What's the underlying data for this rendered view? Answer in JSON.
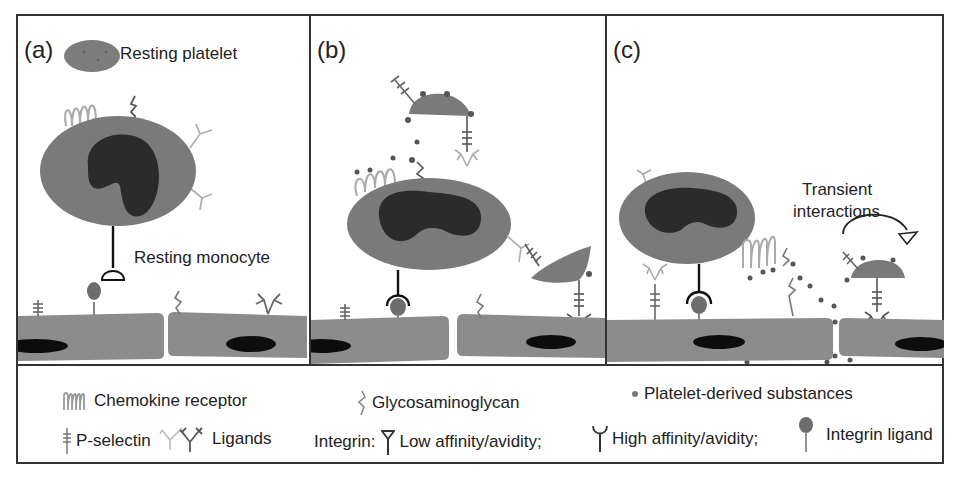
{
  "figure": {
    "panels": [
      {
        "id": "a",
        "label": "(a)",
        "annotations": {
          "platelet": "Resting platelet",
          "monocyte": "Resting monocyte"
        }
      },
      {
        "id": "b",
        "label": "(b)"
      },
      {
        "id": "c",
        "label": "(c)",
        "annotations": {
          "transient_line1": "Transient",
          "transient_line2": "interactions"
        }
      }
    ],
    "legend": {
      "chemokine_receptor": "Chemokine receptor",
      "glycosaminoglycan": "Glycosaminoglycan",
      "platelet_substances": "Platelet-derived substances",
      "p_selectin": "P-selectin",
      "ligands": "Ligands",
      "integrin_prefix": "Integrin:",
      "low_affinity": "Low affinity/avidity;",
      "high_affinity": "High affinity/avidity;",
      "integrin_ligand": "Integrin ligand"
    },
    "colors": {
      "cell_body": "#7a7a7a",
      "nucleus": "#2b2b2b",
      "endothelium": "#8c8c8c",
      "endo_nucleus": "#0d0d0d",
      "receptor_light": "#b3b3b3",
      "border": "#333333"
    }
  }
}
